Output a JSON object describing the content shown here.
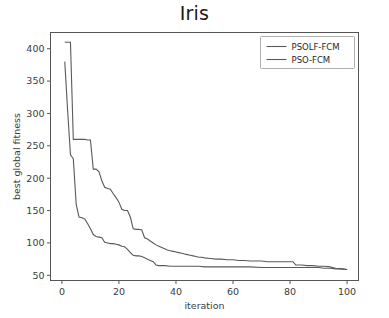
{
  "chart_data": {
    "type": "line",
    "title": "Iris",
    "xlabel": "iteration",
    "ylabel": "best global fitness",
    "xlim": [
      -4,
      104
    ],
    "ylim": [
      42,
      425
    ],
    "xticks": [
      0,
      20,
      40,
      60,
      80,
      100
    ],
    "yticks": [
      50,
      100,
      150,
      200,
      250,
      300,
      350,
      400
    ],
    "grid": false,
    "legend_position": "upper right",
    "series": [
      {
        "name": "PSOLF-FCM",
        "color": "#5a5a5a",
        "x": [
          1,
          2,
          3,
          4,
          5,
          6,
          7,
          8,
          9,
          10,
          11,
          12,
          13,
          14,
          15,
          16,
          17,
          18,
          19,
          20,
          21,
          22,
          23,
          24,
          25,
          26,
          27,
          28,
          29,
          30,
          31,
          32,
          33,
          34,
          35,
          36,
          37,
          38,
          39,
          40,
          41,
          42,
          43,
          44,
          45,
          46,
          47,
          48,
          49,
          50,
          52,
          54,
          56,
          58,
          60,
          62,
          64,
          66,
          68,
          70,
          72,
          74,
          76,
          78,
          80,
          81,
          82,
          84,
          86,
          88,
          90,
          92,
          94,
          95,
          96,
          98,
          100
        ],
        "y": [
          410,
          410,
          410,
          260,
          260,
          260,
          260,
          260,
          259,
          259,
          214,
          214,
          210,
          196,
          186,
          184,
          183,
          176,
          170,
          163,
          152,
          150,
          150,
          140,
          122,
          121,
          121,
          120,
          108,
          106,
          103,
          100,
          97,
          95,
          93,
          91,
          89,
          88,
          87,
          86,
          85,
          84,
          83,
          82,
          81,
          80,
          79,
          78,
          78,
          77,
          76,
          75,
          75,
          74,
          74,
          73,
          73,
          72,
          72,
          72,
          71,
          71,
          71,
          71,
          71,
          71,
          66,
          66,
          65,
          65,
          64,
          64,
          63,
          62,
          61,
          60,
          59
        ]
      },
      {
        "name": "PSO-FCM",
        "color": "#5a5a5a",
        "x": [
          1,
          2,
          3,
          4,
          5,
          6,
          7,
          8,
          9,
          10,
          11,
          12,
          13,
          14,
          15,
          16,
          17,
          18,
          19,
          20,
          21,
          22,
          23,
          24,
          25,
          26,
          27,
          28,
          29,
          30,
          31,
          32,
          33,
          34,
          35,
          36,
          38,
          40,
          42,
          44,
          46,
          48,
          50,
          54,
          58,
          62,
          66,
          70,
          74,
          78,
          82,
          86,
          90,
          92,
          94,
          96,
          98,
          100
        ],
        "y": [
          380,
          305,
          236,
          230,
          160,
          140,
          139,
          137,
          130,
          122,
          113,
          110,
          109,
          108,
          101,
          100,
          99,
          99,
          98,
          97,
          95,
          94,
          90,
          85,
          81,
          80,
          80,
          79,
          77,
          75,
          73,
          71,
          66,
          65,
          65,
          65,
          64,
          64,
          64,
          64,
          64,
          64,
          63,
          63,
          63,
          63,
          63,
          62,
          62,
          62,
          62,
          62,
          62,
          61,
          61,
          60,
          60,
          59
        ]
      }
    ]
  },
  "legend": {
    "entries": [
      {
        "label": "PSOLF-FCM"
      },
      {
        "label": "PSO-FCM"
      }
    ]
  }
}
